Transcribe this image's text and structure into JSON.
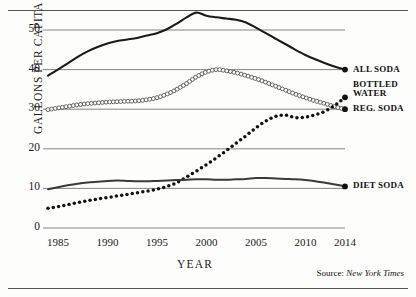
{
  "figure": {
    "source_prefix": "Source:",
    "source_name": "New York Times"
  },
  "axes": {
    "ylabel": "GALLONS PER CAPITA",
    "xlabel": "YEAR",
    "yticks": [
      "0",
      "10",
      "20",
      "30",
      "40",
      "50"
    ],
    "xticks": [
      "1985",
      "1990",
      "1995",
      "2000",
      "2005",
      "2010",
      "2014"
    ]
  },
  "labels": {
    "all_soda": "ALL SODA",
    "bottled_water": "BOTTLED\nWATER",
    "reg_soda": "REG. SODA",
    "diet_soda": "DIET SODA"
  },
  "chart_data": {
    "type": "line",
    "title": "",
    "xlabel": "YEAR",
    "ylabel": "GALLONS PER CAPITA",
    "xlim": [
      1984,
      2014
    ],
    "ylim": [
      0,
      57
    ],
    "yticks": [
      0,
      10,
      20,
      30,
      40,
      50
    ],
    "xticks": [
      1985,
      1990,
      1995,
      2000,
      2005,
      2010,
      2014
    ],
    "grid": "horizontal",
    "legend_position": "right-of-line-ends",
    "x": [
      1984,
      1985,
      1986,
      1987,
      1988,
      1989,
      1990,
      1991,
      1992,
      1993,
      1994,
      1995,
      1996,
      1997,
      1998,
      1999,
      2000,
      2001,
      2002,
      2003,
      2004,
      2005,
      2006,
      2007,
      2008,
      2009,
      2010,
      2011,
      2012,
      2013,
      2014
    ],
    "series": [
      {
        "name": "ALL SODA",
        "style": "solid-thick",
        "color": "#1a1a1a",
        "values": [
          38.5,
          40.0,
          41.6,
          43.2,
          44.6,
          45.7,
          46.6,
          47.2,
          47.6,
          48.0,
          48.6,
          49.2,
          50.2,
          51.6,
          53.2,
          54.4,
          53.6,
          53.2,
          52.9,
          52.6,
          51.9,
          50.6,
          49.2,
          47.8,
          46.4,
          45.0,
          43.7,
          42.6,
          41.6,
          40.7,
          40.0
        ]
      },
      {
        "name": "REG. SODA",
        "style": "chain-circles",
        "color": "#4a4a4a",
        "values": [
          29.9,
          30.3,
          30.7,
          31.1,
          31.4,
          31.6,
          31.8,
          31.9,
          32.0,
          32.1,
          32.4,
          32.9,
          33.8,
          35.0,
          36.5,
          38.2,
          39.4,
          40.0,
          39.7,
          39.2,
          38.5,
          37.7,
          36.8,
          35.8,
          34.8,
          33.8,
          32.9,
          32.1,
          31.4,
          30.6,
          30.0
        ]
      },
      {
        "name": "BOTTLED WATER",
        "style": "dotted",
        "color": "#111111",
        "values": [
          5.0,
          5.4,
          5.9,
          6.4,
          6.9,
          7.3,
          7.7,
          8.1,
          8.5,
          8.9,
          9.3,
          9.8,
          10.5,
          11.4,
          12.9,
          14.4,
          16.0,
          17.7,
          19.5,
          21.4,
          23.3,
          25.3,
          27.0,
          28.2,
          28.5,
          27.9,
          28.0,
          28.6,
          29.5,
          31.0,
          33.0
        ]
      },
      {
        "name": "DIET SODA",
        "style": "solid-medium",
        "color": "#3a3a3a",
        "values": [
          9.8,
          10.3,
          10.8,
          11.2,
          11.5,
          11.7,
          11.9,
          12.0,
          11.9,
          11.8,
          11.8,
          11.9,
          12.0,
          12.1,
          12.2,
          12.3,
          12.3,
          12.2,
          12.2,
          12.3,
          12.4,
          12.6,
          12.6,
          12.5,
          12.4,
          12.3,
          12.1,
          11.8,
          11.4,
          11.0,
          10.5
        ]
      }
    ]
  }
}
